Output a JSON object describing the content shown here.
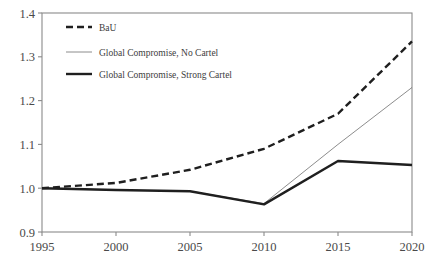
{
  "chart_data": {
    "type": "line",
    "title": "",
    "subtitle": "",
    "xlabel": "",
    "ylabel": "",
    "x": [
      1995,
      2000,
      2005,
      2010,
      2015,
      2020
    ],
    "categories": [
      "1995",
      "2000",
      "2005",
      "2010",
      "2015",
      "2020"
    ],
    "xlim": [
      1995,
      2020
    ],
    "ylim": [
      0.9,
      1.4
    ],
    "xticks": [
      1995,
      2000,
      2005,
      2010,
      2015,
      2020
    ],
    "yticks": [
      0.9,
      1.0,
      1.1,
      1.2,
      1.3,
      1.4
    ],
    "xtick_labels": [
      "1995",
      "2000",
      "2005",
      "2010",
      "2015",
      "2020"
    ],
    "ytick_labels": [
      "0.9",
      "1.0",
      "1.1",
      "1.2",
      "1.3",
      "1.4"
    ],
    "grid": false,
    "legend_position": "upper-left-inside",
    "series": [
      {
        "name": "BaU",
        "style": "dashed",
        "width": 2.4,
        "color": "#1f1f1f",
        "values": [
          1.0,
          1.012,
          1.042,
          1.09,
          1.17,
          1.335
        ]
      },
      {
        "name": "Global Compromise, No Cartel",
        "style": "solid-thin",
        "width": 0.8,
        "color": "#6e6e6e",
        "values": [
          1.0,
          0.996,
          0.993,
          0.965,
          1.1,
          1.23
        ]
      },
      {
        "name": "Global Compromise, Strong Cartel",
        "style": "solid-thick",
        "width": 2.4,
        "color": "#1f1f1f",
        "values": [
          1.0,
          0.996,
          0.993,
          0.963,
          1.062,
          1.053
        ]
      }
    ]
  },
  "legend": {
    "entries": [
      {
        "label": "BaU"
      },
      {
        "label": "Global Compromise, No Cartel"
      },
      {
        "label": "Global Compromise, Strong Cartel"
      }
    ]
  },
  "axes": {
    "y_labels": [
      "1.4",
      "1.3",
      "1.2",
      "1.1",
      "1.0",
      "0.9"
    ],
    "x_labels": [
      "1995",
      "2000",
      "2005",
      "2010",
      "2015",
      "2020"
    ]
  },
  "colors": {
    "frame": "#8a8a8a",
    "background": "#ffffff",
    "bau": "#1f1f1f",
    "no_cartel": "#6e6e6e",
    "strong_cartel": "#1f1f1f",
    "text": "#3d3d3d"
  }
}
